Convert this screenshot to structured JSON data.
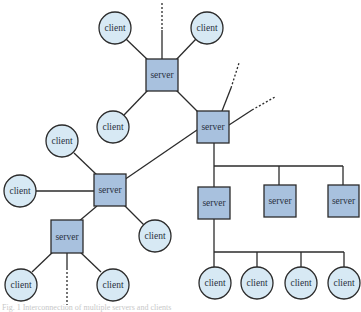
{
  "colors": {
    "server_fill": "#a8c1de",
    "client_fill": "#d7e9f4",
    "stroke": "#2b2b2b",
    "text": "#2a3240"
  },
  "labels": {
    "server": "server",
    "client": "client"
  },
  "caption": "Fig. 1 Interconnection of multiple servers and clients",
  "servers": [
    {
      "id": "s-top",
      "x": 146,
      "y": 59,
      "w": 32,
      "h": 32,
      "label": "server"
    },
    {
      "id": "s-hub",
      "x": 197,
      "y": 111,
      "w": 32,
      "h": 32,
      "label": "server"
    },
    {
      "id": "s-mid-left",
      "x": 94,
      "y": 174,
      "w": 32,
      "h": 32,
      "label": "server"
    },
    {
      "id": "s-low-left",
      "x": 51,
      "y": 220,
      "w": 32,
      "h": 33,
      "label": "server"
    },
    {
      "id": "s-bus-1",
      "x": 198,
      "y": 187,
      "w": 32,
      "h": 32,
      "label": "server"
    },
    {
      "id": "s-bus-2",
      "x": 264,
      "y": 185,
      "w": 32,
      "h": 32,
      "label": "server"
    },
    {
      "id": "s-bus-3",
      "x": 328,
      "y": 185,
      "w": 31,
      "h": 32,
      "label": "server"
    }
  ],
  "clients": [
    {
      "id": "c-top-left",
      "cx": 115,
      "cy": 28,
      "r": 16,
      "label": "client"
    },
    {
      "id": "c-top-right",
      "cx": 207,
      "cy": 28,
      "r": 16,
      "label": "client"
    },
    {
      "id": "c-top-low",
      "cx": 113,
      "cy": 127,
      "r": 16,
      "label": "client"
    },
    {
      "id": "c-left-upper",
      "cx": 62,
      "cy": 141,
      "r": 16,
      "label": "client"
    },
    {
      "id": "c-left",
      "cx": 20,
      "cy": 191,
      "r": 16,
      "label": "client"
    },
    {
      "id": "c-mid-right",
      "cx": 155,
      "cy": 236,
      "r": 16,
      "label": "client"
    },
    {
      "id": "c-bot-1",
      "cx": 21,
      "cy": 285,
      "r": 16,
      "label": "client"
    },
    {
      "id": "c-bot-2",
      "cx": 113,
      "cy": 285,
      "r": 16,
      "label": "client"
    },
    {
      "id": "c-bus-1",
      "cx": 215,
      "cy": 283,
      "r": 16,
      "label": "client"
    },
    {
      "id": "c-bus-2",
      "cx": 257,
      "cy": 283,
      "r": 16,
      "label": "client"
    },
    {
      "id": "c-bus-3",
      "cx": 301,
      "cy": 283,
      "r": 16,
      "label": "client"
    },
    {
      "id": "c-bus-4",
      "cx": 344,
      "cy": 283,
      "r": 16,
      "label": "client"
    }
  ],
  "solid_links": [
    [
      126,
      39,
      150,
      62
    ],
    [
      196,
      39,
      174,
      62
    ],
    [
      162,
      30,
      162,
      59
    ],
    [
      150,
      88,
      124,
      115
    ],
    [
      174,
      88,
      200,
      114
    ],
    [
      222,
      111,
      231,
      88
    ],
    [
      229,
      125,
      252,
      110
    ],
    [
      197,
      130,
      124,
      180
    ],
    [
      74,
      153,
      98,
      176
    ],
    [
      36,
      191,
      94,
      191
    ],
    [
      124,
      205,
      144,
      225
    ],
    [
      97,
      206,
      78,
      222
    ],
    [
      55,
      250,
      32,
      272
    ],
    [
      78,
      250,
      101,
      272
    ],
    [
      67,
      253,
      67,
      268
    ],
    [
      214,
      143,
      214,
      187
    ],
    [
      214,
      166,
      343,
      166
    ],
    [
      279,
      166,
      279,
      185
    ],
    [
      343,
      166,
      343,
      185
    ],
    [
      214,
      219,
      214,
      267
    ],
    [
      214,
      252,
      344,
      252
    ],
    [
      257,
      252,
      257,
      267
    ],
    [
      301,
      252,
      301,
      267
    ],
    [
      344,
      252,
      344,
      267
    ]
  ],
  "dotted_links": [
    [
      162,
      3,
      162,
      30
    ],
    [
      231,
      88,
      239,
      63
    ],
    [
      252,
      110,
      275,
      97
    ],
    [
      67,
      268,
      67,
      305
    ]
  ]
}
